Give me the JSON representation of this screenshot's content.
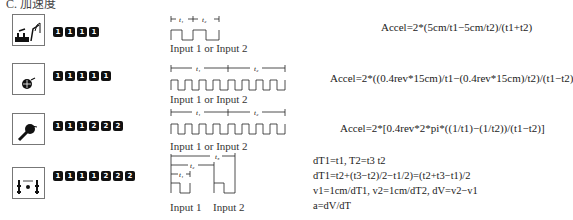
{
  "section_title": "C. 加速度",
  "rows": [
    {
      "icon": "ramp-cart-icon",
      "keys": [
        "1",
        "1",
        "1",
        "1"
      ],
      "wave_label": "Input 1 or Input 2",
      "wave_markers": [
        "t1",
        "t2"
      ],
      "formula": "Accel=2*(5cm/t1−5cm/t2)/(t1+t2)"
    },
    {
      "icon": "pulley-wheel-icon",
      "keys": [
        "1",
        "1",
        "1",
        "1",
        "1"
      ],
      "wave_label": "Input 1 or Input 2",
      "wave_markers": [
        "t1",
        "t2"
      ],
      "formula": "Accel=2*((0.4rev*15cm)/t1−(0.4rev*15cm)/t2)/(t1−t2)"
    },
    {
      "icon": "rotary-sensor-icon",
      "keys": [
        "1",
        "1",
        "1",
        "2",
        "2",
        "2"
      ],
      "wave_label": "Input 1 or Input 2",
      "wave_markers": [
        "t1",
        "t2"
      ],
      "formula": "Accel=2*[0.4rev*2*pi*((1/t1)−(1/t2))/(t1−t2)]"
    },
    {
      "icon": "two-gate-icon",
      "keys": [
        "1",
        "1",
        "1",
        "1",
        "2",
        "2",
        "2"
      ],
      "wave_labels": [
        "Input 1",
        "Input 2"
      ],
      "wave_markers": [
        "t1",
        "t2",
        "t3"
      ],
      "formula_lines": [
        "dT1=t1,  T2=t3  t2",
        "dT1=t2+(t3−t2)/2−t1/2)=(t2+t3−t1)/2",
        "v1=1cm/dT1,  v2=1cm/dT2,  dV=v2−v1",
        "a=dV/dT"
      ]
    }
  ]
}
